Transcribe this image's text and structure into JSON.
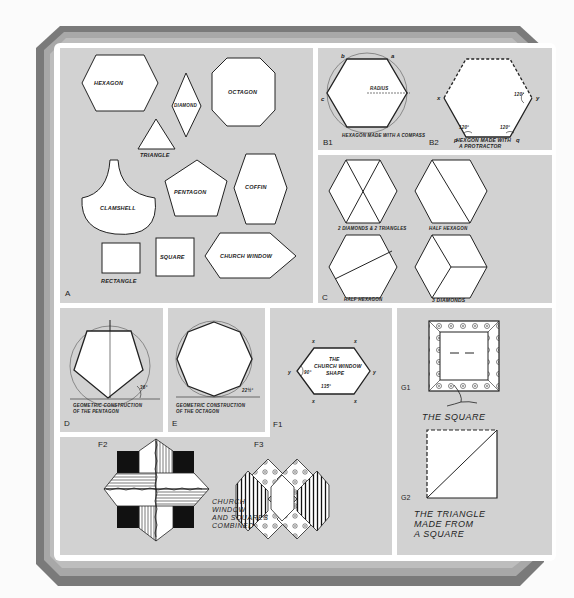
{
  "colors": {
    "background": "#fbfbfb",
    "frame_outer": "#777777",
    "frame_mid": "#a9a9a9",
    "frame_white": "#ffffff",
    "panel": "#d2d2d2",
    "stroke": "#222222",
    "fill_shape": "#ffffff",
    "fill_dark": "#111111"
  },
  "panels": {
    "A": {
      "label": "A",
      "shapes": {
        "hexagon": "HEXAGON",
        "diamond": "DIAMOND",
        "octagon": "OCTAGON",
        "triangle": "TRIANGLE",
        "clamshell": "CLAMSHELL",
        "pentagon": "PENTAGON",
        "coffin": "COFFIN",
        "rectangle": "RECTANGLE",
        "square": "SQUARE",
        "church_window": "CHURCH WINDOW"
      }
    },
    "B1": {
      "label": "B1",
      "caption": "HEXAGON MADE WITH A COMPASS",
      "radius_label": "RADIUS",
      "points": [
        "b",
        "a",
        "c"
      ]
    },
    "B2": {
      "label": "B2",
      "caption_line1": "HEXGON MADE WITH",
      "caption_line2": "A PROTRACTOR",
      "angle": "120°",
      "points": [
        "x",
        "y",
        "p",
        "q"
      ]
    },
    "C": {
      "label": "C",
      "captions": [
        "2 DIAMONDS & 2 TRIANGLES",
        "HALF HEXAGON",
        "HALF HEXAGON",
        "3 DIAMONDS"
      ]
    },
    "D": {
      "label": "D",
      "caption_line1": "GEOMETRIC CONSTRUCTION",
      "caption_line2": "OF THE PENTAGON",
      "angle": "36°"
    },
    "E": {
      "label": "E",
      "caption_line1": "GEOMETRIC CONSTRUCTION",
      "caption_line2": "OF THE OCTAGON",
      "angle": "22½°"
    },
    "F1": {
      "label": "F1",
      "title_line1": "THE",
      "title_line2": "CHURCH WINDOW",
      "title_line3": "SHAPE",
      "angle_small": "90°",
      "angle_large": "135°",
      "point_x": "x",
      "point_y": "y"
    },
    "F2": {
      "label": "F2",
      "caption_line1": "CHURCH",
      "caption_line2": "WINDOW",
      "caption_line3": "AND SQUARES",
      "caption_line4": "COMBINED"
    },
    "F3": {
      "label": "F3"
    },
    "G1": {
      "label": "G1",
      "caption": "THE SQUARE"
    },
    "G2": {
      "label": "G2",
      "caption_line1": "THE TRIANGLE",
      "caption_line2": "MADE FROM",
      "caption_line3": "A SQUARE"
    }
  }
}
